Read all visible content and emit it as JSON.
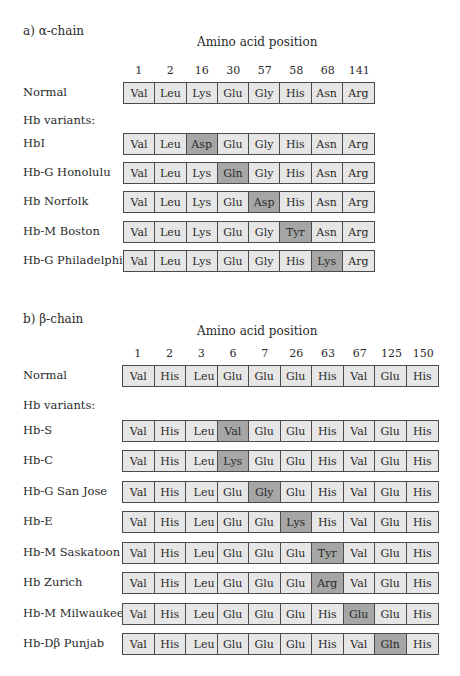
{
  "alpha": {
    "title": "a) α-chain",
    "heading": "Amino acid position",
    "positions": [
      "1",
      "2",
      "16",
      "30",
      "57",
      "58",
      "68",
      "141"
    ],
    "normal": {
      "label": "Normal",
      "residues": [
        "Val",
        "Leu",
        "Lys",
        "Glu",
        "Gly",
        "His",
        "Asn",
        "Arg"
      ]
    },
    "variants_label": "Hb variants:",
    "variants": [
      {
        "label": "HbI",
        "residues": [
          "Val",
          "Leu",
          "Asp",
          "Glu",
          "Gly",
          "His",
          "Asn",
          "Arg"
        ],
        "highlight": 2
      },
      {
        "label": "Hb-G Honolulu",
        "residues": [
          "Val",
          "Leu",
          "Lys",
          "Gln",
          "Gly",
          "His",
          "Asn",
          "Arg"
        ],
        "highlight": 3
      },
      {
        "label": "Hb Norfolk",
        "residues": [
          "Val",
          "Leu",
          "Lys",
          "Glu",
          "Asp",
          "His",
          "Asn",
          "Arg"
        ],
        "highlight": 4
      },
      {
        "label": "Hb-M Boston",
        "residues": [
          "Val",
          "Leu",
          "Lys",
          "Glu",
          "Gly",
          "Tyr",
          "Asn",
          "Arg"
        ],
        "highlight": 5
      },
      {
        "label": "Hb-G Philadelphia",
        "residues": [
          "Val",
          "Leu",
          "Lys",
          "Glu",
          "Gly",
          "His",
          "Lys",
          "Arg"
        ],
        "highlight": 6
      }
    ]
  },
  "beta": {
    "title": "b) β-chain",
    "heading": "Amino acid position",
    "positions": [
      "1",
      "2",
      "3",
      "6",
      "7",
      "26",
      "63",
      "67",
      "125",
      "150"
    ],
    "normal": {
      "label": "Normal",
      "residues": [
        "Val",
        "His",
        "Leu",
        "Glu",
        "Glu",
        "Glu",
        "His",
        "Val",
        "Glu",
        "His"
      ]
    },
    "variants_label": "Hb variants:",
    "variants": [
      {
        "label": "Hb-S",
        "residues": [
          "Val",
          "His",
          "Leu",
          "Val",
          "Glu",
          "Glu",
          "His",
          "Val",
          "Glu",
          "His"
        ],
        "highlight": 3
      },
      {
        "label": "Hb-C",
        "residues": [
          "Val",
          "His",
          "Leu",
          "Lys",
          "Glu",
          "Glu",
          "His",
          "Val",
          "Glu",
          "His"
        ],
        "highlight": 3
      },
      {
        "label": "Hb-G San Jose",
        "residues": [
          "Val",
          "His",
          "Leu",
          "Glu",
          "Gly",
          "Glu",
          "His",
          "Val",
          "Glu",
          "His"
        ],
        "highlight": 4
      },
      {
        "label": "Hb-E",
        "residues": [
          "Val",
          "His",
          "Leu",
          "Glu",
          "Glu",
          "Lys",
          "His",
          "Val",
          "Glu",
          "His"
        ],
        "highlight": 5
      },
      {
        "label": "Hb-M Saskatoon",
        "residues": [
          "Val",
          "His",
          "Leu",
          "Glu",
          "Glu",
          "Glu",
          "Tyr",
          "Val",
          "Glu",
          "His"
        ],
        "highlight": 6
      },
      {
        "label": "Hb Zurich",
        "residues": [
          "Val",
          "His",
          "Leu",
          "Glu",
          "Glu",
          "Glu",
          "Arg",
          "Val",
          "Glu",
          "His"
        ],
        "highlight": 6
      },
      {
        "label": "Hb-M Milwaukee-1",
        "residues": [
          "Val",
          "His",
          "Leu",
          "Glu",
          "Glu",
          "Glu",
          "His",
          "Glu",
          "Glu",
          "His"
        ],
        "highlight": 7
      },
      {
        "label": "Hb-Dβ Punjab",
        "residues": [
          "Val",
          "His",
          "Leu",
          "Glu",
          "Glu",
          "Glu",
          "His",
          "Val",
          "Gln",
          "His"
        ],
        "highlight": 8
      }
    ]
  },
  "colors": {
    "cell": "#e6e6e6",
    "highlight": "#a6a6a6",
    "border": "#4a4a4a"
  }
}
